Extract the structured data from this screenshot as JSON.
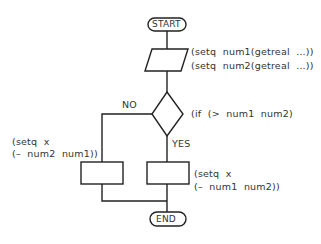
{
  "diagram": {
    "type": "flowchart",
    "nodes": {
      "start": {
        "label": "START",
        "shape": "terminator"
      },
      "input": {
        "shape": "parallelogram",
        "annotation_lines": [
          "(setq  num1(getreal  ...))",
          "(setq  num2(getreal  ...))"
        ]
      },
      "decision": {
        "shape": "diamond",
        "annotation": "(if  (>  num1  num2)"
      },
      "no_branch": {
        "label": "NO",
        "shape": "process",
        "annotation_lines": [
          "(setq  x",
          "(–  num2  num1))"
        ]
      },
      "yes_branch": {
        "label": "YES",
        "shape": "process",
        "annotation_lines": [
          "(setq  x",
          "(–  num1  num2))"
        ]
      },
      "end": {
        "label": "END",
        "shape": "terminator"
      }
    },
    "colors": {
      "stroke": "#222222",
      "text": "#333333",
      "background": "#ffffff"
    }
  }
}
